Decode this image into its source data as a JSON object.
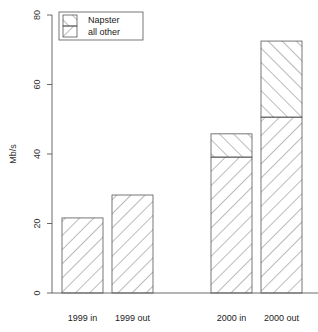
{
  "chart_data": {
    "type": "bar",
    "stacked": true,
    "title": "",
    "xlabel": "",
    "ylabel": "Mb/s",
    "ylim": [
      0,
      80
    ],
    "yticks": [
      0,
      20,
      40,
      60,
      80
    ],
    "grid": false,
    "legend_position": "top-left",
    "categories": [
      "1999 in",
      "1999 out",
      "2000 in",
      "2000 out"
    ],
    "series": [
      {
        "name": "all other",
        "pattern": "backslash-hatch",
        "values": [
          21.6,
          28.2,
          39.1,
          50.6
        ]
      },
      {
        "name": "Napster",
        "pattern": "forwardslash-hatch",
        "values": [
          0,
          0,
          6.7,
          21.9
        ]
      }
    ],
    "totals": [
      21.6,
      28.2,
      45.8,
      72.5
    ]
  },
  "axis": {
    "ylabel": "Mb/s",
    "yticks": [
      "0",
      "20",
      "40",
      "60",
      "80"
    ]
  },
  "legend": {
    "items": [
      "Napster",
      "all other"
    ]
  },
  "categories": [
    "1999 in",
    "1999 out",
    "2000 in",
    "2000 out"
  ]
}
